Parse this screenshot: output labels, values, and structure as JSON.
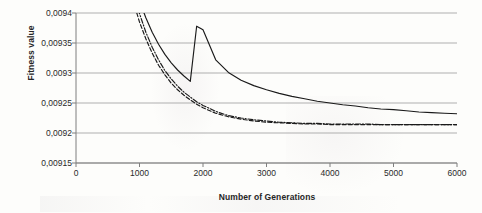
{
  "chart_data": {
    "type": "line",
    "title": "",
    "xlabel": "Number of Generations",
    "ylabel": "Fitness value",
    "xlim": [
      0,
      6000
    ],
    "ylim": [
      0.00915,
      0.0094
    ],
    "grid": true,
    "legend": "none",
    "decimal_separator": ",",
    "xticks": [
      "0",
      "1000",
      "2000",
      "3000",
      "4000",
      "5000",
      "6000"
    ],
    "xtick_values": [
      0,
      1000,
      2000,
      3000,
      4000,
      5000,
      6000
    ],
    "yticks": [
      "0,00915",
      "0,0092",
      "0,00925",
      "0,0093",
      "0,00935",
      "0,0094"
    ],
    "ytick_values": [
      0.00915,
      0.0092,
      0.00925,
      0.0093,
      0.00935,
      0.0094
    ],
    "x": [
      900,
      1000,
      1100,
      1200,
      1300,
      1400,
      1500,
      1600,
      1700,
      1800,
      1900,
      2000,
      2200,
      2400,
      2600,
      2800,
      3000,
      3200,
      3400,
      3600,
      3800,
      4000,
      4200,
      4400,
      4600,
      4800,
      5000,
      5200,
      5400,
      5600,
      5800,
      6000
    ],
    "series": [
      {
        "name": "Series 1",
        "style": "solid",
        "color": "#1a1a1a",
        "values": [
          0.009455,
          0.00942,
          0.009392,
          0.009368,
          0.009348,
          0.009331,
          0.009317,
          0.009305,
          0.009295,
          0.009286,
          0.009378,
          0.009372,
          0.009322,
          0.009301,
          0.009288,
          0.009279,
          0.009272,
          0.009266,
          0.009261,
          0.009257,
          0.009253,
          0.00925,
          0.009247,
          0.009245,
          0.009242,
          0.00924,
          0.009239,
          0.009237,
          0.009235,
          0.009234,
          0.009233,
          0.009232
        ]
      },
      {
        "name": "Series 2",
        "style": "dashed",
        "color": "#1a1a1a",
        "values": [
          0.00942,
          0.009385,
          0.009357,
          0.009333,
          0.009313,
          0.009297,
          0.009283,
          0.009272,
          0.009263,
          0.009255,
          0.009248,
          0.009242,
          0.009233,
          0.009227,
          0.009223,
          0.00922,
          0.009218,
          0.009217,
          0.009216,
          0.009215,
          0.009215,
          0.009214,
          0.009214,
          0.009214,
          0.009214,
          0.009214,
          0.009214,
          0.009214,
          0.009214,
          0.009214,
          0.009214,
          0.009214
        ]
      },
      {
        "name": "Series 3",
        "style": "dash-dot",
        "color": "#1a1a1a",
        "values": [
          0.009438,
          0.009399,
          0.009368,
          0.009343,
          0.009322,
          0.009304,
          0.00929,
          0.009278,
          0.009268,
          0.00926,
          0.009252,
          0.009246,
          0.009236,
          0.009229,
          0.009225,
          0.009222,
          0.00922,
          0.009218,
          0.009217,
          0.009216,
          0.009216,
          0.009215,
          0.009215,
          0.009215,
          0.009215,
          0.009214,
          0.009214,
          0.009214,
          0.009214,
          0.009214,
          0.009214,
          0.009214
        ]
      }
    ]
  },
  "axes": {
    "plot_left_px": 76,
    "plot_right_px": 457,
    "plot_top_px": 13,
    "plot_bottom_px": 163,
    "axis_color": "#7f7f7f",
    "grid_color": "#a6a6a6"
  }
}
